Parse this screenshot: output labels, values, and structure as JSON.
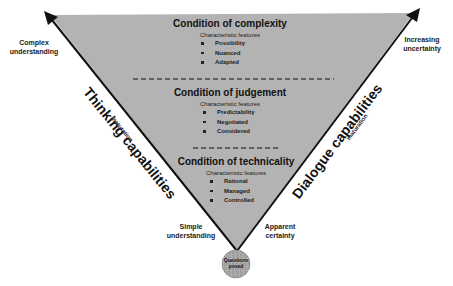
{
  "diagram": {
    "colors": {
      "triangle_fill": "#b3b3b3",
      "triangle_stroke": "#111111",
      "circle_fill": "#a8a8a8",
      "background": "#ffffff"
    },
    "corner_labels": {
      "top_left": [
        "Complex",
        "understanding"
      ],
      "top_right": [
        "Increasing",
        "uncertainty"
      ],
      "bottom_left": [
        "Simple",
        "understanding"
      ],
      "bottom_right": [
        "Apparent",
        "certainty"
      ]
    },
    "axes": {
      "left": {
        "title": "Thinking capabilities",
        "subtitle": "maturation"
      },
      "right": {
        "title": "Dialogue capabilities",
        "subtitle": "maturation"
      }
    },
    "conditions": [
      {
        "title": "Condition of complexity",
        "subtitle": "Characteristic features",
        "features": [
          "Possibility",
          "Nuanced",
          "Adapted"
        ]
      },
      {
        "title": "Condition of judgement",
        "subtitle": "Characteristic features",
        "features": [
          "Predictability",
          "Negotiated",
          "Considered"
        ]
      },
      {
        "title": "Condition of technicality",
        "subtitle": "Characteristic features",
        "features": [
          "Rational",
          "Managed",
          "Controlled"
        ]
      }
    ],
    "apex_circle": {
      "lines": [
        "Questions",
        "posed"
      ]
    }
  }
}
